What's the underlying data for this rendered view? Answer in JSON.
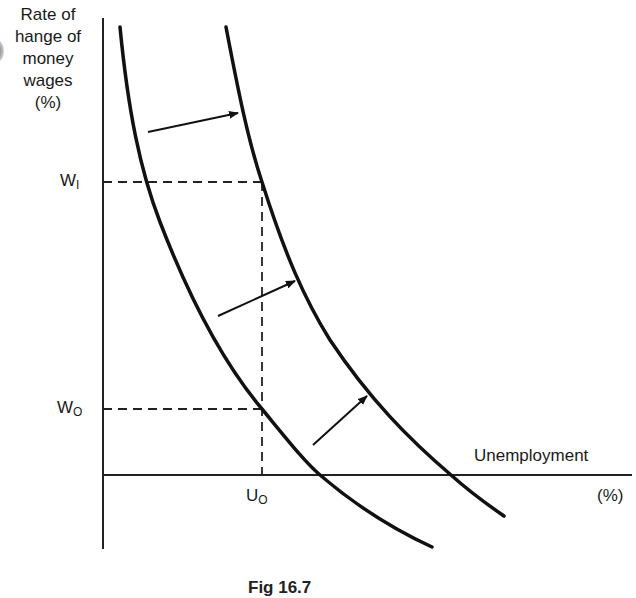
{
  "diagram": {
    "y_axis": {
      "label_lines": [
        "Rate of",
        "hange of",
        "money",
        "wages",
        "(%)"
      ]
    },
    "x_axis": {
      "label": "Unemployment",
      "unit": "(%)"
    },
    "markers": {
      "w1": {
        "main": "W",
        "sub": "I"
      },
      "w0": {
        "main": "W",
        "sub": "O"
      },
      "u0": {
        "main": "U",
        "sub": "O"
      }
    },
    "caption": "Fig 16.7",
    "curves": [
      {
        "name": "original-phillips-curve",
        "points": [
          [
            120,
            27
          ],
          [
            146,
            182
          ],
          [
            200,
            330
          ],
          [
            262,
            409
          ],
          [
            320,
            475
          ],
          [
            432,
            547
          ]
        ]
      },
      {
        "name": "shifted-phillips-curve",
        "points": [
          [
            226,
            27
          ],
          [
            262,
            182
          ],
          [
            330,
            330
          ],
          [
            451,
            475
          ],
          [
            504,
            516
          ]
        ]
      }
    ],
    "arrows": [
      {
        "from": [
          148,
          132
        ],
        "to": [
          238,
          113
        ]
      },
      {
        "from": [
          218,
          316
        ],
        "to": [
          295,
          281
        ]
      },
      {
        "from": [
          313,
          445
        ],
        "to": [
          367,
          396
        ]
      }
    ],
    "colors": {
      "ink": "#111111",
      "background": "#ffffff"
    }
  }
}
